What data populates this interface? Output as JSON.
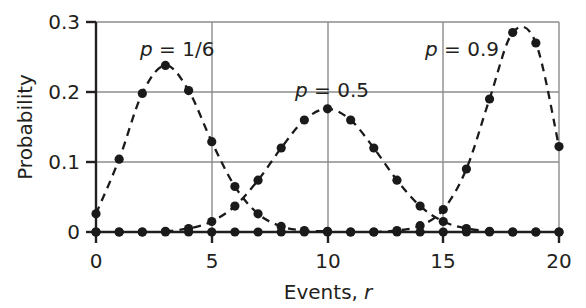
{
  "chart_data": {
    "type": "scatter",
    "title": "",
    "xlabel": "Events, r",
    "ylabel": "Probability",
    "xlim": [
      0,
      20
    ],
    "ylim": [
      0,
      0.3
    ],
    "grid": true,
    "legend_position": "inline-annotations",
    "x_ticks": [
      0,
      5,
      10,
      15,
      20
    ],
    "x_tick_labels": [
      "0",
      "5",
      "10",
      "15",
      "20"
    ],
    "y_ticks": [
      0,
      0.1,
      0.2,
      0.3
    ],
    "y_tick_labels": [
      "0",
      "0.1",
      "0.2",
      "0.3"
    ],
    "x": [
      0,
      1,
      2,
      3,
      4,
      5,
      6,
      7,
      8,
      9,
      10,
      11,
      12,
      13,
      14,
      15,
      16,
      17,
      18,
      19,
      20
    ],
    "series": [
      {
        "name": "p = 1/6",
        "label_text": "p = 1/6",
        "label_x": 3.4,
        "label_y": 0.272,
        "marker": "filled-circle",
        "line_style": "dashed",
        "color": "#1a1a1a",
        "values": [
          0.026,
          0.104,
          0.198,
          0.238,
          0.202,
          0.129,
          0.065,
          0.026,
          0.008,
          0.002,
          0.001,
          0.0,
          0.0,
          0.0,
          0.0,
          0.0,
          0.0,
          0.0,
          0.0,
          0.0,
          0.0
        ]
      },
      {
        "name": "p = 0.5",
        "label_text": "p = 0.5",
        "label_x": 9.0,
        "label_y": 0.203,
        "marker": "filled-circle",
        "line_style": "dashed",
        "color": "#1a1a1a",
        "values": [
          0.0,
          0.0,
          0.0,
          0.001,
          0.005,
          0.015,
          0.037,
          0.074,
          0.12,
          0.16,
          0.176,
          0.16,
          0.12,
          0.074,
          0.037,
          0.015,
          0.005,
          0.001,
          0.0,
          0.0,
          0.0
        ]
      },
      {
        "name": "p = 0.9",
        "label_text": "p = 0.9",
        "label_x": 15.1,
        "label_y": 0.272,
        "marker": "filled-circle",
        "line_style": "dashed",
        "color": "#1a1a1a",
        "values": [
          0.0,
          0.0,
          0.0,
          0.0,
          0.0,
          0.0,
          0.0,
          0.0,
          0.0,
          0.0,
          0.0,
          0.0,
          0.0,
          0.002,
          0.009,
          0.032,
          0.09,
          0.19,
          0.285,
          0.27,
          0.122
        ]
      }
    ]
  },
  "axes": {
    "y_tick_0": "0",
    "y_tick_1": "0.1",
    "y_tick_2": "0.2",
    "y_tick_3": "0.3",
    "x_tick_0": "0",
    "x_tick_1": "5",
    "x_tick_2": "10",
    "x_tick_3": "15",
    "x_tick_4": "20",
    "x_title_main": "Events,",
    "x_title_italic": "r",
    "y_title": "Probability"
  },
  "annotations": {
    "label_1_p": "p",
    "label_1_rest": " = 1/6",
    "label_2_p": "p",
    "label_2_rest": " = 0.5",
    "label_3_p": "p",
    "label_3_rest": " = 0.9"
  },
  "style": {
    "grid_color": "#808080",
    "axis_color": "#231f20",
    "marker_color": "#1a1a1a"
  }
}
